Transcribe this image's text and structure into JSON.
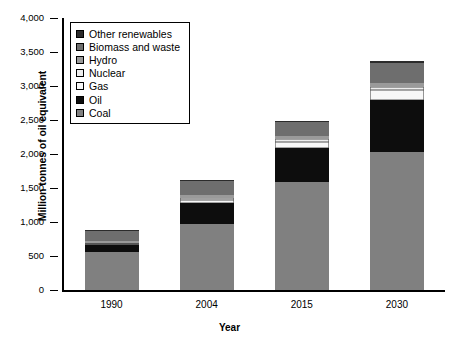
{
  "chart_data": {
    "type": "bar",
    "stacked": true,
    "title": "",
    "xlabel": "Year",
    "ylabel": "Million tonnes of oil equivalent",
    "categories": [
      "1990",
      "2004",
      "2015",
      "2030"
    ],
    "ylim": [
      0,
      4000
    ],
    "ytick_step": 500,
    "ytick_labels": [
      "0",
      "500",
      "1,000",
      "1,500",
      "2,000",
      "2,500",
      "3,000",
      "3,500",
      "4,000"
    ],
    "ytick_values": [
      0,
      500,
      1000,
      1500,
      2000,
      2500,
      3000,
      3500,
      4000
    ],
    "grid": false,
    "legend_position": "top-left",
    "series": [
      {
        "name": "Coal",
        "color": "#808080",
        "values": [
          560,
          975,
          1585,
          2040
        ]
      },
      {
        "name": "Oil",
        "color": "#0d0d0d",
        "values": [
          100,
          310,
          500,
          765
        ]
      },
      {
        "name": "Gas",
        "color": "#f7f7f7",
        "values": [
          25,
          45,
          95,
          135
        ]
      },
      {
        "name": "Nuclear",
        "color": "#ededed",
        "values": [
          15,
          25,
          40,
          50
        ]
      },
      {
        "name": "Hydro",
        "color": "#9a9a9a",
        "values": [
          25,
          40,
          45,
          55
        ]
      },
      {
        "name": "Biomass and waste",
        "color": "#6e6e6e",
        "values": [
          145,
          215,
          205,
          300
        ]
      },
      {
        "name": "Other renewables",
        "color": "#2b2b2b",
        "values": [
          10,
          10,
          20,
          25
        ]
      }
    ],
    "totals": [
      880,
      1620,
      2490,
      3370
    ]
  },
  "legend": {
    "items": [
      {
        "label": "Other renewables",
        "swatch": "legend-swatch-other-renewables"
      },
      {
        "label": "Biomass and waste",
        "swatch": "legend-swatch-biomass-and-waste"
      },
      {
        "label": "Hydro",
        "swatch": "legend-swatch-hydro"
      },
      {
        "label": "Nuclear",
        "swatch": "legend-swatch-nuclear"
      },
      {
        "label": "Gas",
        "swatch": "legend-swatch-gas"
      },
      {
        "label": "Oil",
        "swatch": "legend-swatch-oil"
      },
      {
        "label": "Coal",
        "swatch": "legend-swatch-coal"
      }
    ]
  }
}
